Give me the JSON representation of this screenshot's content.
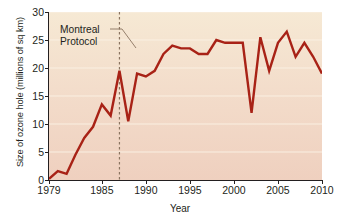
{
  "chart_data": {
    "type": "line",
    "title": "",
    "xlabel": "Year",
    "ylabel": "Size of ozone hole (millions of sq km)",
    "xlim": [
      1979,
      2010
    ],
    "ylim": [
      0,
      30
    ],
    "xticks": [
      1979,
      1985,
      1990,
      1995,
      2000,
      2005,
      2010
    ],
    "yticks": [
      0,
      5,
      10,
      15,
      20,
      25,
      30
    ],
    "grid": "horizontal",
    "legend": "none",
    "series": [
      {
        "name": "Size of ozone hole",
        "color": "#a82216",
        "x": [
          1979,
          1980,
          1981,
          1982,
          1983,
          1984,
          1985,
          1986,
          1987,
          1988,
          1989,
          1990,
          1991,
          1992,
          1993,
          1994,
          1995,
          1996,
          1997,
          1998,
          1999,
          2000,
          2001,
          2002,
          2003,
          2004,
          2005,
          2006,
          2007,
          2008,
          2009,
          2010
        ],
        "y": [
          0.2,
          1.6,
          1.1,
          4.5,
          7.5,
          9.5,
          13.5,
          11.5,
          19.5,
          10.5,
          19.0,
          18.5,
          19.5,
          22.5,
          24.0,
          23.5,
          23.5,
          22.5,
          22.5,
          25.0,
          24.5,
          24.5,
          24.5,
          12.0,
          25.5,
          19.5,
          24.5,
          26.5,
          22.0,
          24.5,
          22.0,
          19.0
        ]
      }
    ],
    "annotations": [
      {
        "label_line1": "Montreal",
        "label_line2": "Protocol",
        "x": 1987,
        "style": "dashed-vertical-line-with-leader"
      }
    ]
  },
  "figure": {
    "background": "#ffffff",
    "plot_background_top": "#f6e9d4",
    "plot_background_bottom": "#efd0bf",
    "gridline_color": "#faf0e2",
    "axis_color": "#231f20",
    "annotation_line_color": "#8a7460"
  }
}
